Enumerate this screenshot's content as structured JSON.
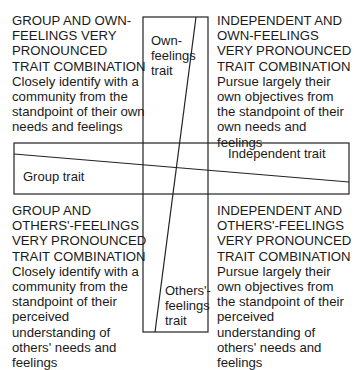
{
  "diagram": {
    "quadrants": {
      "top_left": {
        "heading": [
          "GROUP AND OWN-",
          "FEELINGS VERY",
          "PRONOUNCED",
          "TRAIT COMBINATION"
        ],
        "description": [
          "Closely identify with a",
          "community from the",
          "standpoint of their own",
          "needs and feelings"
        ]
      },
      "top_right": {
        "heading": [
          "INDEPENDENT AND",
          "OWN-FEELINGS",
          "VERY PRONOUNCED",
          "TRAIT COMBINATION"
        ],
        "description": [
          "Pursue largely their",
          "own objectives from",
          "the standpoint of their",
          "own needs and",
          "feelings"
        ]
      },
      "bottom_left": {
        "heading": [
          "GROUP AND",
          "OTHERS'-FEELINGS",
          "VERY PRONOUNCED",
          "TRAIT COMBINATION"
        ],
        "description": [
          "Closely identify with a",
          "community from the",
          "standpoint of their",
          "perceived",
          "understanding of",
          "others' needs and",
          "feelings"
        ]
      },
      "bottom_right": {
        "heading": [
          "INDEPENDENT AND",
          "OTHERS'-FEELINGS",
          "VERY PRONOUNCED",
          "TRAIT COMBINATION"
        ],
        "description": [
          "Pursue largely their",
          "own objectives from",
          "the standpoint of their",
          "perceived",
          "understanding of",
          "others' needs and",
          "feelings"
        ]
      }
    },
    "axis_labels": {
      "own_feelings": [
        "Own-",
        "feelings",
        "trait"
      ],
      "others_feelings": [
        "Others'-",
        "feelings",
        "trait"
      ],
      "independent": "Independent trait",
      "group": "Group trait"
    },
    "line_color": "#222222"
  }
}
